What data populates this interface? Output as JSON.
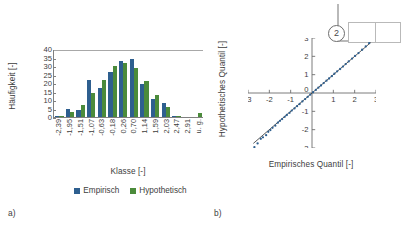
{
  "schematic": {
    "marker_label": "2"
  },
  "panels": [
    {
      "id": "a",
      "label": "a)"
    },
    {
      "id": "b",
      "label": "b)"
    }
  ],
  "chart_data": [
    {
      "type": "bar",
      "panel": "a",
      "title": "",
      "xlabel": "Klasse [-]",
      "ylabel": "Häufigkeit [-]",
      "ylim": [
        0,
        40
      ],
      "yticks": [
        40,
        35,
        30,
        25,
        20,
        15,
        10,
        5,
        0
      ],
      "grid": false,
      "legend_position": "bottom",
      "categories": [
        "-2,39",
        "-1,95",
        "-1,51",
        "-1,07",
        "-0,63",
        "-0,18",
        "0,26",
        "0,70",
        "1,14",
        "1,59",
        "2,03",
        "2,47",
        "2,91",
        "u. g."
      ],
      "series": [
        {
          "name": "Empirisch",
          "color": "#2e5f8f",
          "values": [
            0.5,
            5,
            4,
            21.5,
            17,
            26.5,
            33,
            34,
            19.5,
            10.5,
            8,
            0.5,
            0,
            0
          ]
        },
        {
          "name": "Hypothetisch",
          "color": "#4b8b3b",
          "values": [
            0.5,
            3,
            7,
            14,
            22,
            30,
            32,
            29,
            21,
            13,
            6,
            0.5,
            0,
            2.5
          ]
        }
      ]
    },
    {
      "type": "scatter",
      "panel": "b",
      "title": "",
      "xlabel": "Empirisches Quantil [-]",
      "ylabel": "Hypothetisches Quantil [-]",
      "xlim": [
        -3,
        3
      ],
      "ylim": [
        -3,
        3
      ],
      "xticks": [
        -3,
        -2,
        -1,
        0,
        1,
        2,
        3
      ],
      "yticks": [
        -3,
        -2,
        -1,
        0,
        1,
        2,
        3
      ],
      "grid": false,
      "trendline": {
        "slope": 1.0,
        "intercept": 0.0,
        "x_start": -2.75,
        "x_end": 2.75
      },
      "points": [
        [
          -2.7,
          -2.95
        ],
        [
          -2.55,
          -2.75
        ],
        [
          -2.4,
          -2.5
        ],
        [
          -2.3,
          -2.42
        ],
        [
          -2.15,
          -2.3
        ],
        [
          -2.05,
          -2.12
        ],
        [
          -1.95,
          -2.02
        ],
        [
          -1.85,
          -1.9
        ],
        [
          -1.72,
          -1.78
        ],
        [
          -1.6,
          -1.62
        ],
        [
          -1.5,
          -1.52
        ],
        [
          -1.4,
          -1.42
        ],
        [
          -1.28,
          -1.3
        ],
        [
          -1.18,
          -1.2
        ],
        [
          -1.05,
          -1.08
        ],
        [
          -0.95,
          -0.96
        ],
        [
          -0.82,
          -0.84
        ],
        [
          -0.7,
          -0.72
        ],
        [
          -0.58,
          -0.6
        ],
        [
          -0.45,
          -0.46
        ],
        [
          -0.32,
          -0.33
        ],
        [
          -0.2,
          -0.21
        ],
        [
          -0.08,
          -0.09
        ],
        [
          0.05,
          0.04
        ],
        [
          0.18,
          0.17
        ],
        [
          0.3,
          0.29
        ],
        [
          0.42,
          0.41
        ],
        [
          0.55,
          0.54
        ],
        [
          0.68,
          0.67
        ],
        [
          0.8,
          0.79
        ],
        [
          0.93,
          0.92
        ],
        [
          1.05,
          1.05
        ],
        [
          1.18,
          1.18
        ],
        [
          1.32,
          1.31
        ],
        [
          1.45,
          1.44
        ],
        [
          1.58,
          1.58
        ],
        [
          1.72,
          1.72
        ],
        [
          1.88,
          1.88
        ],
        [
          2.02,
          2.02
        ],
        [
          2.18,
          2.18
        ],
        [
          2.35,
          2.36
        ],
        [
          2.52,
          2.54
        ],
        [
          2.68,
          2.72
        ]
      ]
    }
  ]
}
